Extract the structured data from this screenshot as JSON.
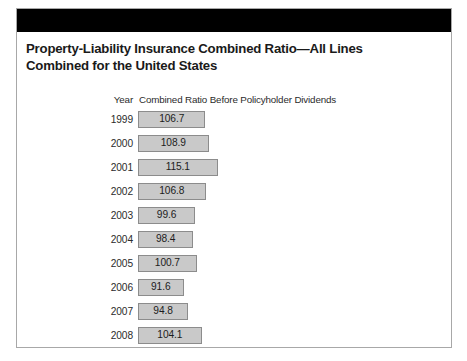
{
  "figure": {
    "title": "Property-Liability Insurance Combined Ratio—All Lines Combined for the United States"
  },
  "colors": {
    "header_band": "#000000",
    "frame_border": "#a8a8a8",
    "bar_fill": "#c9c9c9",
    "bar_border": "#8c8c8c",
    "text": "#1c1c1c",
    "background": "#ffffff"
  },
  "chart_data": {
    "type": "bar",
    "orientation": "horizontal",
    "title": "Property-Liability Insurance Combined Ratio—All Lines Combined for the United States",
    "xlabel": "",
    "ylabel": "",
    "column_headers": [
      "Year",
      "Combined Ratio Before Policyholder Dividends"
    ],
    "categories": [
      "1999",
      "2000",
      "2001",
      "2002",
      "2003",
      "2004",
      "2005",
      "2006",
      "2007",
      "2008"
    ],
    "values": [
      106.7,
      108.9,
      115.1,
      106.8,
      99.6,
      98.4,
      100.7,
      91.6,
      94.8,
      104.1
    ],
    "value_labels": [
      "106.7",
      "108.9",
      "115.1",
      "106.8",
      "99.6",
      "98.4",
      "100.7",
      "91.6",
      "94.8",
      "104.1"
    ],
    "xlim": [
      0,
      115.1
    ],
    "grid": false,
    "legend": false,
    "bars": [
      {
        "year": "1999",
        "value": 106.7,
        "label": "106.7"
      },
      {
        "year": "2000",
        "value": 108.9,
        "label": "108.9"
      },
      {
        "year": "2001",
        "value": 115.1,
        "label": "115.1"
      },
      {
        "year": "2002",
        "value": 106.8,
        "label": "106.8"
      },
      {
        "year": "2003",
        "value": 99.6,
        "label": "99.6"
      },
      {
        "year": "2004",
        "value": 98.4,
        "label": "98.4"
      },
      {
        "year": "2005",
        "value": 100.7,
        "label": "100.7"
      },
      {
        "year": "2006",
        "value": 91.6,
        "label": "91.6"
      },
      {
        "year": "2007",
        "value": 94.8,
        "label": "94.8"
      },
      {
        "year": "2008",
        "value": 104.1,
        "label": "104.1"
      }
    ]
  },
  "layout": {
    "bar_origin_x": 138,
    "bar_max_x": 371,
    "row_start_y": 111,
    "row_pitch": 24,
    "bar_height": 17,
    "scale_px_per_unit": 1.45,
    "baseline_value": 60.2
  }
}
